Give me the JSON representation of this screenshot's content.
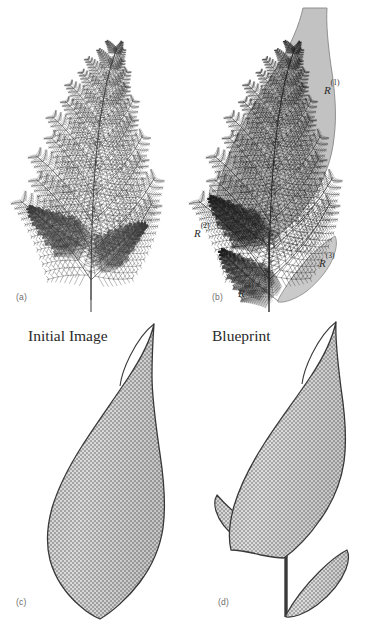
{
  "figure": {
    "background_color": "#ffffff",
    "ink_color": "#2a2a2a",
    "fill_gray": "#9a9a9a",
    "shade_gray": "#8f8f8f",
    "width": 365,
    "height": 624
  },
  "panels": [
    {
      "id": "a",
      "label": "(a)",
      "description": "Fern fractal attractor drawn as fine line fronds",
      "label_x": 16,
      "label_y": 292
    },
    {
      "id": "b",
      "label": "(b)",
      "description": "Fern fractal with four self-similar regions shaded and labelled",
      "label_x": 212,
      "label_y": 292
    },
    {
      "id": "c",
      "label": "(c)",
      "description": "Initial image: a single stippled leaf blade",
      "label_x": 16,
      "label_y": 597
    },
    {
      "id": "d",
      "label": "(d)",
      "description": "Blueprint: blade plus two side leaflets and stem",
      "label_x": 218,
      "label_y": 597
    }
  ],
  "captions": [
    {
      "text": "Initial Image",
      "x": 28,
      "y": 327
    },
    {
      "text": "Blueprint",
      "x": 212,
      "y": 327
    }
  ],
  "region_labels": [
    {
      "base": "R",
      "superscript": "(1)",
      "x": 324,
      "y": 82,
      "region": "main-upper-blade"
    },
    {
      "base": "R",
      "superscript": "(2)",
      "x": 194,
      "y": 225,
      "region": "left-leaflet"
    },
    {
      "base": "R",
      "superscript": "(3)",
      "x": 319,
      "y": 255,
      "region": "right-leaflet"
    },
    {
      "base": "R",
      "superscript": "(4)",
      "x": 238,
      "y": 285,
      "region": "stem"
    }
  ]
}
